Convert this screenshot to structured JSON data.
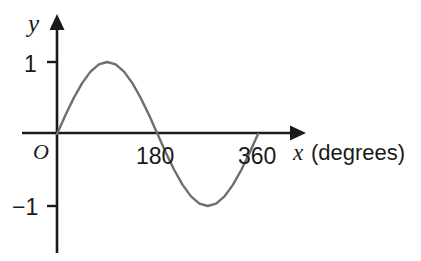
{
  "figure": {
    "background_color": "#ffffff",
    "axis_color": "#1a1a1a",
    "curve_color": "#6e6e6e",
    "y_axis_label": "y",
    "origin_label": "O",
    "x_axis_label_variable": "x",
    "x_axis_label_units": "(degrees)",
    "y_tick_labels": [
      "1",
      "−1"
    ],
    "x_tick_labels": [
      "180",
      "360"
    ]
  },
  "chart_data": {
    "type": "line",
    "title": "",
    "xlabel": "x (degrees)",
    "ylabel": "y",
    "xlim": [
      0,
      360
    ],
    "ylim": [
      -1,
      1
    ],
    "grid": false,
    "legend": null,
    "xticks": [
      180,
      360
    ],
    "xticklabels": [
      "180",
      "360"
    ],
    "yticks": [
      -1,
      1
    ],
    "yticklabels": [
      "1",
      "−1"
    ],
    "origin_label": "O",
    "series": [
      {
        "name": "y = sin(x)",
        "color": "#6e6e6e",
        "x": [
          0,
          15,
          30,
          45,
          60,
          75,
          90,
          105,
          120,
          135,
          150,
          165,
          180,
          195,
          210,
          225,
          240,
          255,
          270,
          285,
          300,
          315,
          330,
          345,
          360
        ],
        "y": [
          0,
          0.259,
          0.5,
          0.707,
          0.866,
          0.966,
          1,
          0.966,
          0.866,
          0.707,
          0.5,
          0.259,
          0,
          -0.259,
          -0.5,
          -0.707,
          -0.866,
          -0.966,
          -1,
          -0.966,
          -0.866,
          -0.707,
          -0.5,
          -0.259,
          0
        ]
      }
    ],
    "annotations": {
      "maximum": {
        "x": 90,
        "y": 1
      },
      "minimum": {
        "x": 270,
        "y": -1
      },
      "zero_crossings": [
        0,
        180,
        360
      ]
    }
  }
}
